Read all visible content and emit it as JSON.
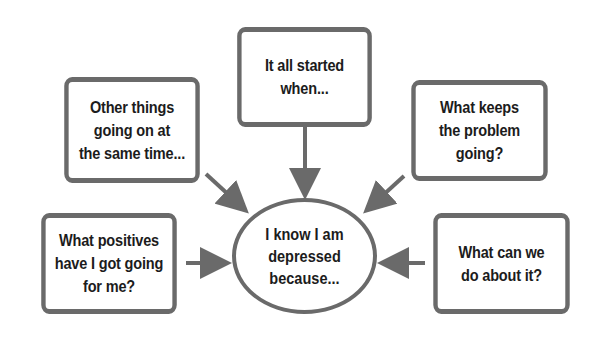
{
  "diagram": {
    "type": "mind-map",
    "center": {
      "text": "I know I am\ndepressed\nbecause..."
    },
    "nodes": [
      {
        "id": "top",
        "text": "It all started\nwhen..."
      },
      {
        "id": "top_left",
        "text": "Other things\ngoing on at\nthe same time..."
      },
      {
        "id": "top_right",
        "text": "What keeps\nthe problem\ngoing?"
      },
      {
        "id": "bottom_left",
        "text": "What positives\nhave I got going\nfor me?"
      },
      {
        "id": "bottom_right",
        "text": "What can we\ndo about it?"
      }
    ],
    "arrows_point_to": "center",
    "colors": {
      "stroke": "#6a6a6a",
      "text": "#1c1c1c",
      "background": "#ffffff"
    }
  }
}
